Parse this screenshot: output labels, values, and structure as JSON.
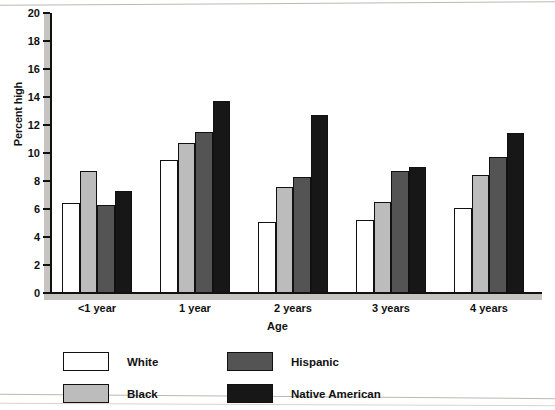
{
  "chart_data": {
    "type": "bar",
    "title": "",
    "xlabel": "Age",
    "ylabel": "Percent high",
    "categories": [
      "<1 year",
      "1 year",
      "2 years",
      "3 years",
      "4 years"
    ],
    "series": [
      {
        "name": "White",
        "color": "#ffffff",
        "values": [
          6.4,
          9.5,
          5.1,
          5.2,
          6.1
        ]
      },
      {
        "name": "Black",
        "color": "#bcbcbc",
        "values": [
          8.7,
          10.7,
          7.6,
          6.5,
          8.4
        ]
      },
      {
        "name": "Hispanic",
        "color": "#545454",
        "values": [
          6.3,
          11.5,
          8.3,
          8.7,
          9.7
        ]
      },
      {
        "name": "Native American",
        "color": "#171717",
        "values": [
          7.3,
          13.7,
          12.7,
          9.0,
          11.4
        ]
      }
    ],
    "ylim": [
      0,
      20
    ],
    "yticks": [
      0,
      2,
      4,
      6,
      8,
      10,
      12,
      14,
      16,
      18,
      20
    ],
    "ytick_labels": [
      "0",
      "2",
      "4",
      "6",
      "8",
      "10",
      "12",
      "14",
      "16",
      "18",
      "20"
    ],
    "grid": false,
    "legend_position": "below-plot",
    "legend_entries": [
      "White",
      "Black",
      "Hispanic",
      "Native American"
    ]
  }
}
